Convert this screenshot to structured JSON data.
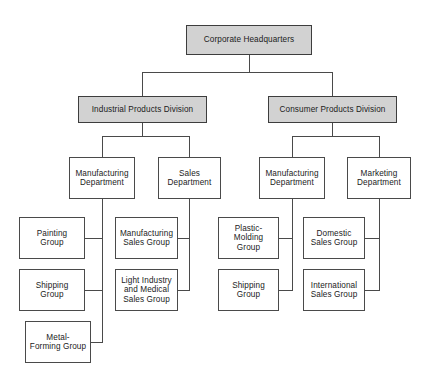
{
  "chart_data": {
    "type": "diagram",
    "diagram_kind": "org-chart",
    "orientation": "top-down",
    "colors": {
      "box_fill": "#ffffff",
      "highlight_fill": "#d2d2d2",
      "border": "#4a4a4a",
      "line": "#4a4a4a",
      "text": "#1b1b1b",
      "background": "#ffffff"
    },
    "levels": [
      "headquarters",
      "division",
      "department",
      "group"
    ],
    "nodes": [
      {
        "id": "hq",
        "label": "Corporate Headquarters",
        "level": 0,
        "parent": null,
        "filled": true,
        "x": 186,
        "y": 25,
        "w": 126,
        "h": 30
      },
      {
        "id": "ind-div",
        "label": "Industrial Products Division",
        "level": 1,
        "parent": "hq",
        "filled": true,
        "x": 78,
        "y": 96,
        "w": 129,
        "h": 27
      },
      {
        "id": "con-div",
        "label": "Consumer Products Division",
        "level": 1,
        "parent": "hq",
        "filled": true,
        "x": 268,
        "y": 96,
        "w": 129,
        "h": 27
      },
      {
        "id": "ind-mfg",
        "label": "Manufacturing\nDepartment",
        "level": 2,
        "parent": "ind-div",
        "filled": false,
        "x": 69,
        "y": 157,
        "w": 66,
        "h": 42
      },
      {
        "id": "ind-sales",
        "label": "Sales\nDepartment",
        "level": 2,
        "parent": "ind-div",
        "filled": false,
        "x": 158,
        "y": 157,
        "w": 63,
        "h": 42
      },
      {
        "id": "con-mfg",
        "label": "Manufacturing\nDepartment",
        "level": 2,
        "parent": "con-div",
        "filled": false,
        "x": 259,
        "y": 157,
        "w": 66,
        "h": 42
      },
      {
        "id": "con-mkt",
        "label": "Marketing\nDepartment",
        "level": 2,
        "parent": "con-div",
        "filled": false,
        "x": 347,
        "y": 157,
        "w": 64,
        "h": 42
      },
      {
        "id": "painting",
        "label": "Painting\nGroup",
        "level": 3,
        "parent": "ind-mfg",
        "filled": false,
        "x": 19,
        "y": 217,
        "w": 66,
        "h": 42
      },
      {
        "id": "shipping-1",
        "label": "Shipping\nGroup",
        "level": 3,
        "parent": "ind-mfg",
        "filled": false,
        "x": 19,
        "y": 269,
        "w": 66,
        "h": 42
      },
      {
        "id": "metal-forming",
        "label": "Metal-\nForming Group",
        "level": 3,
        "parent": "ind-mfg",
        "filled": false,
        "x": 25,
        "y": 321,
        "w": 66,
        "h": 42
      },
      {
        "id": "mfg-sales",
        "label": "Manufacturing\nSales Group",
        "level": 3,
        "parent": "ind-sales",
        "filled": false,
        "x": 115,
        "y": 217,
        "w": 63,
        "h": 42
      },
      {
        "id": "light-ind-sales",
        "label": "Light Industry\nand Medical\nSales Group",
        "level": 3,
        "parent": "ind-sales",
        "filled": false,
        "x": 115,
        "y": 269,
        "w": 63,
        "h": 42
      },
      {
        "id": "plastic-molding",
        "label": "Plastic-\nMolding\nGroup",
        "level": 3,
        "parent": "con-mfg",
        "filled": false,
        "x": 218,
        "y": 217,
        "w": 61,
        "h": 42
      },
      {
        "id": "shipping-2",
        "label": "Shipping\nGroup",
        "level": 3,
        "parent": "con-mfg",
        "filled": false,
        "x": 218,
        "y": 269,
        "w": 61,
        "h": 42
      },
      {
        "id": "domestic-sales",
        "label": "Domestic\nSales Group",
        "level": 3,
        "parent": "con-mkt",
        "filled": false,
        "x": 303,
        "y": 217,
        "w": 62,
        "h": 42
      },
      {
        "id": "international-sales",
        "label": "International\nSales Group",
        "level": 3,
        "parent": "con-mkt",
        "filled": false,
        "x": 303,
        "y": 269,
        "w": 62,
        "h": 42
      }
    ],
    "connectors": [
      {
        "from": "hq",
        "to": "ind-div",
        "style": "elbow-down"
      },
      {
        "from": "hq",
        "to": "con-div",
        "style": "elbow-down"
      },
      {
        "from": "ind-div",
        "to": "ind-mfg",
        "style": "elbow-down"
      },
      {
        "from": "ind-div",
        "to": "ind-sales",
        "style": "elbow-down"
      },
      {
        "from": "con-div",
        "to": "con-mfg",
        "style": "elbow-down"
      },
      {
        "from": "con-div",
        "to": "con-mkt",
        "style": "elbow-down"
      },
      {
        "from": "ind-mfg",
        "to": "painting",
        "style": "spine-left"
      },
      {
        "from": "ind-mfg",
        "to": "shipping-1",
        "style": "spine-left"
      },
      {
        "from": "ind-mfg",
        "to": "metal-forming",
        "style": "spine-left"
      },
      {
        "from": "ind-sales",
        "to": "mfg-sales",
        "style": "spine-left"
      },
      {
        "from": "ind-sales",
        "to": "light-ind-sales",
        "style": "spine-left"
      },
      {
        "from": "con-mfg",
        "to": "plastic-molding",
        "style": "spine-left"
      },
      {
        "from": "con-mfg",
        "to": "shipping-2",
        "style": "spine-left"
      },
      {
        "from": "con-mkt",
        "to": "domestic-sales",
        "style": "spine-left"
      },
      {
        "from": "con-mkt",
        "to": "international-sales",
        "style": "spine-left"
      }
    ]
  }
}
